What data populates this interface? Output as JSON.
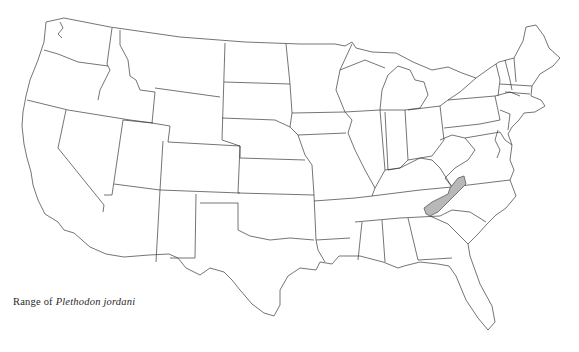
{
  "figure": {
    "caption_prefix": "Range of",
    "caption_species": "Plethodon jordani",
    "range_fill_color": "#b8b8b8",
    "outline_color": "#3a3a3a",
    "background_color": "#ffffff"
  },
  "map": {
    "region": "Contiguous United States",
    "highlighted_region": "Southern Appalachians (western North Carolina, eastern Tennessee, southwestern Virginia)"
  }
}
